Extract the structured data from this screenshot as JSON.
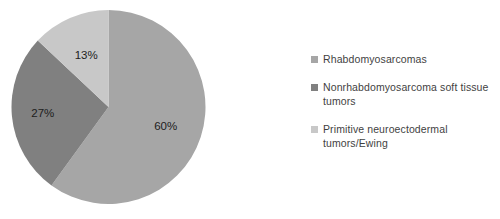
{
  "chart_data": {
    "type": "pie",
    "title": "",
    "categories": [
      "Rhabdomyosarcomas",
      "Nonrhabdomyosarcoma soft tissue tumors",
      "Primitive neuroectodermal tumors/Ewing"
    ],
    "values": [
      60,
      27,
      13
    ],
    "value_labels": [
      "60%",
      "27%",
      "13%"
    ],
    "unit": "%",
    "colors": [
      "#a6a6a6",
      "#808080",
      "#c8c8c8"
    ],
    "start_angle_deg": 0,
    "direction": "clockwise",
    "legend_position": "right",
    "grid": false,
    "background": "#ffffff",
    "label_color": "#1d1d1d"
  },
  "pie": {
    "slices": [
      {
        "label": "60%",
        "value": 60,
        "color": "#a6a6a6",
        "name": "Rhabdomyosarcomas"
      },
      {
        "label": "27%",
        "value": 27,
        "color": "#808080",
        "name": "Nonrhabdomyosarcoma soft tissue tumors"
      },
      {
        "label": "13%",
        "value": 13,
        "color": "#c8c8c8",
        "name": "Primitive neuroectodermal tumors/Ewing"
      }
    ]
  },
  "legend": {
    "items": [
      {
        "label": "Rhabdomyosarcomas",
        "color": "#a6a6a6"
      },
      {
        "label": "Nonrhabdomyosarcoma soft tissue tumors",
        "color": "#808080"
      },
      {
        "label": "Primitive neuroectodermal tumors/Ewing",
        "color": "#c8c8c8"
      }
    ]
  }
}
